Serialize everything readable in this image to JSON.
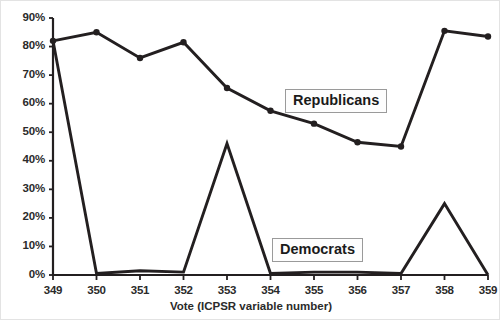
{
  "chart_data": {
    "type": "line",
    "title": "",
    "subtitle": "",
    "xlabel": "Vote (ICPSR variable number)",
    "ylabel": "",
    "categories": [
      "349",
      "350",
      "351",
      "352",
      "353",
      "354",
      "355",
      "356",
      "357",
      "358",
      "359"
    ],
    "x": [
      349,
      350,
      351,
      352,
      353,
      354,
      355,
      356,
      357,
      358,
      359
    ],
    "series": [
      {
        "name": "Republicans",
        "values": [
          82,
          85,
          76,
          81.5,
          65.5,
          57.5,
          53,
          46.5,
          45,
          85.5,
          83.5
        ],
        "markers": true,
        "color": "#231f20"
      },
      {
        "name": "Democrats",
        "values": [
          82,
          0.5,
          1.5,
          1,
          46,
          0.5,
          1,
          1,
          0.5,
          25,
          0
        ],
        "markers": false,
        "color": "#231f20"
      }
    ],
    "ylim": [
      0,
      90
    ],
    "yticks": [
      "0%",
      "10%",
      "20%",
      "30%",
      "40%",
      "50%",
      "60%",
      "70%",
      "80%",
      "90%"
    ],
    "ytick_values": [
      0,
      10,
      20,
      30,
      40,
      50,
      60,
      70,
      80,
      90
    ],
    "xlim": [
      349,
      359
    ],
    "grid": false,
    "legend_position": "inline-annotations",
    "annotations": [
      {
        "text": "Republicans",
        "series": "Republicans"
      },
      {
        "text": "Democrats",
        "series": "Democrats"
      }
    ]
  },
  "axis": {
    "y_ticks": [
      {
        "label": "90%",
        "value": 90
      },
      {
        "label": "80%",
        "value": 80
      },
      {
        "label": "70%",
        "value": 70
      },
      {
        "label": "60%",
        "value": 60
      },
      {
        "label": "50%",
        "value": 50
      },
      {
        "label": "40%",
        "value": 40
      },
      {
        "label": "30%",
        "value": 30
      },
      {
        "label": "20%",
        "value": 20
      },
      {
        "label": "10%",
        "value": 10
      },
      {
        "label": "0%",
        "value": 0
      }
    ],
    "x_ticks": [
      {
        "label": "349"
      },
      {
        "label": "350"
      },
      {
        "label": "351"
      },
      {
        "label": "352"
      },
      {
        "label": "353"
      },
      {
        "label": "354"
      },
      {
        "label": "355"
      },
      {
        "label": "356"
      },
      {
        "label": "357"
      },
      {
        "label": "358"
      },
      {
        "label": "359"
      }
    ],
    "x_title": "Vote (ICPSR variable number)"
  },
  "labels": {
    "republicans": "Republicans",
    "democrats": "Democrats"
  },
  "colors": {
    "line": "#231f20",
    "axis": "#231f20",
    "text": "#2b2b2b",
    "label_box_border": "#9a9a9a",
    "label_box_fill": "#fdfdfd",
    "background": "#ffffff"
  }
}
